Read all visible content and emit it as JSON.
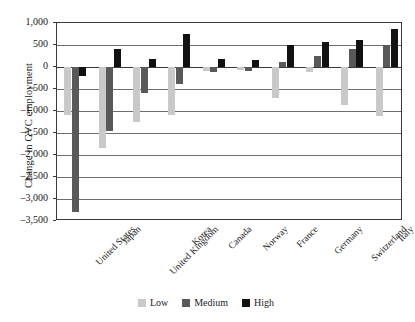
{
  "chart_data": {
    "type": "bar",
    "title": "",
    "xlabel": "",
    "ylabel": "Change in GVC employment",
    "ylim": [
      -3500,
      1000
    ],
    "ytick_labels": [
      "1,000",
      "500",
      "0",
      "–500",
      "–1,000",
      "–1,500",
      "–2,000",
      "–2,500",
      "–3,000",
      "–3,500"
    ],
    "ytick_values": [
      1000,
      500,
      0,
      -500,
      -1000,
      -1500,
      -2000,
      -2500,
      -3000,
      -3500
    ],
    "grid": true,
    "legend_position": "bottom-center",
    "categories": [
      "United States",
      "Japan",
      "United Kingdom",
      "Korea",
      "Canada",
      "Norway",
      "France",
      "Germany",
      "Switzerland",
      "Italy"
    ],
    "series": [
      {
        "name": "Low",
        "color": "#c9c9c9",
        "values": [
          -1100,
          -1830,
          -1250,
          -1080,
          -90,
          -70,
          -700,
          -120,
          -870,
          -1120
        ]
      },
      {
        "name": "Medium",
        "color": "#595959",
        "values": [
          -3300,
          -1450,
          -600,
          -380,
          -120,
          -90,
          110,
          240,
          410,
          500
        ]
      },
      {
        "name": "High",
        "color": "#111111",
        "values": [
          -200,
          400,
          180,
          760,
          190,
          170,
          510,
          560,
          620,
          870
        ]
      }
    ]
  },
  "legend": {
    "items": [
      {
        "label": "Low"
      },
      {
        "label": "Medium"
      },
      {
        "label": "High"
      }
    ]
  }
}
